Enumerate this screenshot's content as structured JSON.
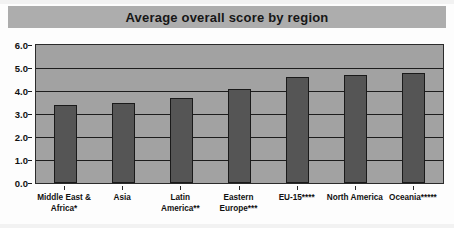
{
  "chart_data": {
    "type": "bar",
    "title": "Average overall score by region",
    "xlabel": "",
    "ylabel": "",
    "ylim": [
      0.0,
      6.0
    ],
    "ytick_step": 1.0,
    "grid": true,
    "legend": "none",
    "categories": [
      "Middle East & Africa*",
      "Asia",
      "Latin America**",
      "Eastern Europe***",
      "EU-15****",
      "North America",
      "Oceania*****"
    ],
    "category_lines": [
      [
        "Middle East &",
        "Africa*"
      ],
      [
        "Asia",
        ""
      ],
      [
        "Latin",
        "America**"
      ],
      [
        "Eastern",
        "Europe***"
      ],
      [
        "EU-15****",
        ""
      ],
      [
        "North America",
        ""
      ],
      [
        "Oceania*****",
        ""
      ]
    ],
    "values": [
      3.4,
      3.5,
      3.7,
      4.1,
      4.6,
      4.7,
      4.8
    ],
    "ytick_labels": [
      "0.0",
      "1.0",
      "2.0",
      "3.0",
      "4.0",
      "5.0",
      "6.0"
    ],
    "ytick_values": [
      0.0,
      1.0,
      2.0,
      3.0,
      4.0,
      5.0,
      6.0
    ]
  },
  "colors": {
    "bar_fill": "#555555",
    "bar_edge": "#1a1a1a",
    "plot_background": "#a2a2a2",
    "title_banner": "#adadad",
    "gridline": "#1d1d1d",
    "text": "#111111",
    "page_background": "#fdfdfd"
  }
}
